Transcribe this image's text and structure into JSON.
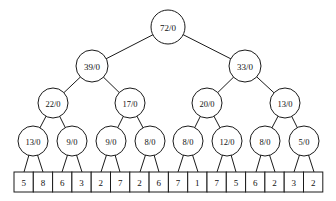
{
  "figure": {
    "background_color": "#ffffff",
    "stroke_color": "#1a1a1a",
    "text_color": "#111111",
    "width": 336,
    "height": 201
  },
  "tree": {
    "levels": [
      {
        "level": 1,
        "nodes": [
          {
            "label": "72/0",
            "cx": 168,
            "cy": 27,
            "r": 17,
            "font_size": 9
          }
        ]
      },
      {
        "level": 2,
        "nodes": [
          {
            "label": "39/0",
            "cx": 92,
            "cy": 66,
            "r": 16,
            "font_size": 9
          },
          {
            "label": "33/0",
            "cx": 245,
            "cy": 66,
            "r": 16,
            "font_size": 9
          }
        ]
      },
      {
        "level": 3,
        "nodes": [
          {
            "label": "22/0",
            "cx": 53,
            "cy": 103,
            "r": 15,
            "font_size": 8.5
          },
          {
            "label": "17/0",
            "cx": 130,
            "cy": 103,
            "r": 15,
            "font_size": 8.5
          },
          {
            "label": "20/0",
            "cx": 207,
            "cy": 103,
            "r": 15,
            "font_size": 8.5
          },
          {
            "label": "13/0",
            "cx": 285,
            "cy": 103,
            "r": 15,
            "font_size": 8.5
          }
        ]
      },
      {
        "level": 4,
        "nodes": [
          {
            "label": "13/0",
            "cx": 33,
            "cy": 141,
            "r": 15,
            "font_size": 8.5
          },
          {
            "label": "9/0",
            "cx": 72,
            "cy": 141,
            "r": 15,
            "font_size": 8.5
          },
          {
            "label": "9/0",
            "cx": 111,
            "cy": 141,
            "r": 15,
            "font_size": 8.5
          },
          {
            "label": "8/0",
            "cx": 150,
            "cy": 141,
            "r": 15,
            "font_size": 8.5
          },
          {
            "label": "8/0",
            "cx": 188,
            "cy": 141,
            "r": 15,
            "font_size": 8.5
          },
          {
            "label": "12/0",
            "cx": 227,
            "cy": 141,
            "r": 15,
            "font_size": 8.5
          },
          {
            "label": "8/0",
            "cx": 265,
            "cy": 141,
            "r": 15,
            "font_size": 8.5
          },
          {
            "label": "5/0",
            "cx": 304,
            "cy": 141,
            "r": 15,
            "font_size": 8.5
          }
        ]
      }
    ],
    "edges": [
      {
        "x1": 168,
        "y1": 27,
        "x2": 92,
        "y2": 66
      },
      {
        "x1": 168,
        "y1": 27,
        "x2": 245,
        "y2": 66
      },
      {
        "x1": 92,
        "y1": 66,
        "x2": 53,
        "y2": 103
      },
      {
        "x1": 92,
        "y1": 66,
        "x2": 130,
        "y2": 103
      },
      {
        "x1": 245,
        "y1": 66,
        "x2": 207,
        "y2": 103
      },
      {
        "x1": 245,
        "y1": 66,
        "x2": 285,
        "y2": 103
      },
      {
        "x1": 53,
        "y1": 103,
        "x2": 33,
        "y2": 141
      },
      {
        "x1": 53,
        "y1": 103,
        "x2": 72,
        "y2": 141
      },
      {
        "x1": 130,
        "y1": 103,
        "x2": 111,
        "y2": 141
      },
      {
        "x1": 130,
        "y1": 103,
        "x2": 150,
        "y2": 141
      },
      {
        "x1": 207,
        "y1": 103,
        "x2": 188,
        "y2": 141
      },
      {
        "x1": 207,
        "y1": 103,
        "x2": 227,
        "y2": 141
      },
      {
        "x1": 285,
        "y1": 103,
        "x2": 265,
        "y2": 141
      },
      {
        "x1": 285,
        "y1": 103,
        "x2": 304,
        "y2": 141
      },
      {
        "x1": 33,
        "y1": 141,
        "x2": 24,
        "y2": 172
      },
      {
        "x1": 33,
        "y1": 141,
        "x2": 43,
        "y2": 172
      },
      {
        "x1": 72,
        "y1": 141,
        "x2": 62,
        "y2": 172
      },
      {
        "x1": 72,
        "y1": 141,
        "x2": 82,
        "y2": 172
      },
      {
        "x1": 111,
        "y1": 141,
        "x2": 101,
        "y2": 172
      },
      {
        "x1": 111,
        "y1": 141,
        "x2": 120,
        "y2": 172
      },
      {
        "x1": 150,
        "y1": 141,
        "x2": 140,
        "y2": 172
      },
      {
        "x1": 150,
        "y1": 141,
        "x2": 159,
        "y2": 172
      },
      {
        "x1": 188,
        "y1": 141,
        "x2": 178,
        "y2": 172
      },
      {
        "x1": 188,
        "y1": 141,
        "x2": 198,
        "y2": 172
      },
      {
        "x1": 227,
        "y1": 141,
        "x2": 217,
        "y2": 172
      },
      {
        "x1": 227,
        "y1": 141,
        "x2": 236,
        "y2": 172
      },
      {
        "x1": 265,
        "y1": 141,
        "x2": 256,
        "y2": 172
      },
      {
        "x1": 265,
        "y1": 141,
        "x2": 275,
        "y2": 172
      },
      {
        "x1": 304,
        "y1": 141,
        "x2": 294,
        "y2": 172
      },
      {
        "x1": 304,
        "y1": 141,
        "x2": 314,
        "y2": 172
      }
    ]
  },
  "array": {
    "x": 14,
    "y": 172,
    "cell_width": 19.3,
    "cell_height": 20,
    "font_size": 9,
    "values": [
      "5",
      "8",
      "6",
      "3",
      "2",
      "7",
      "2",
      "6",
      "7",
      "1",
      "7",
      "5",
      "6",
      "2",
      "3",
      "2"
    ]
  }
}
